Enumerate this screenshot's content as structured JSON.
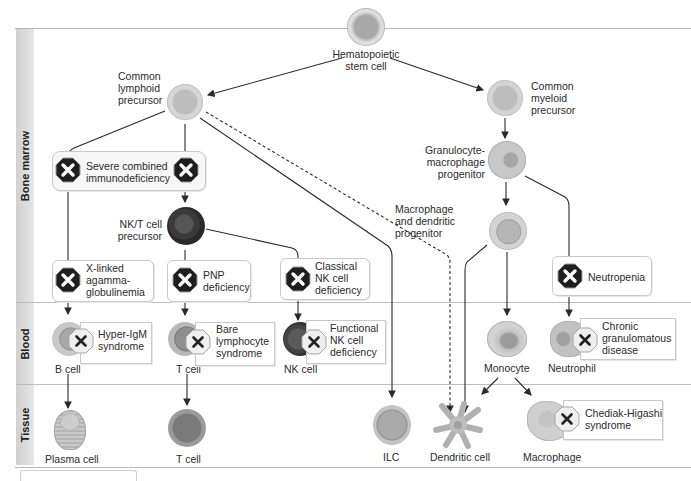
{
  "bands": [
    {
      "id": "bone-marrow",
      "label": "Bone marrow"
    },
    {
      "id": "blood",
      "label": "Blood"
    },
    {
      "id": "tissue",
      "label": "Tissue"
    }
  ],
  "cells": {
    "hsc": "Hematopoietic\nstem cell",
    "clp": "Common\nlymphoid\nprecursor",
    "cmp": "Common\nmyeloid\nprecursor",
    "gmp": "Granulocyte-\nmacrophage\nprogenitor",
    "mdp": "Macrophage\nand dendritic\nprogenitor",
    "nkt": "NK/T cell\nprecursor",
    "b_cell": "B cell",
    "t_cell_blood": "T cell",
    "nk_cell": "NK cell",
    "monocyte": "Monocyte",
    "neutrophil": "Neutrophil",
    "plasma_cell": "Plasma cell",
    "t_cell_tissue": "T cell",
    "ilc": "ILC",
    "dendritic_cell": "Dendritic cell",
    "macrophage": "Macrophage"
  },
  "deficiencies": {
    "scid": "Severe combined\nimmunodeficiency",
    "xla": "X-linked\nagamma-\nglobulinemia",
    "pnp": "PNP\ndeficiency",
    "classical_nk": "Classical\nNK cell\ndeficiency",
    "neutropenia": "Neutropenia",
    "hyper_igm": "Hyper-IgM\nsyndrome",
    "bare_lymphocyte": "Bare\nlymphocyte\nsyndrome",
    "functional_nk": "Functional\nNK cell\ndeficiency",
    "cgd": "Chronic\ngranulomatous\ndisease",
    "chediak_higashi": "Chediak-Higashi\nsyndrome"
  },
  "colors": {
    "stop_dark": "#1e1e1e",
    "stop_light": "#ededed",
    "line": "#2a2a2a",
    "cell_gray": "#b5b5b5",
    "nk_dark": "#3a3a3a"
  }
}
